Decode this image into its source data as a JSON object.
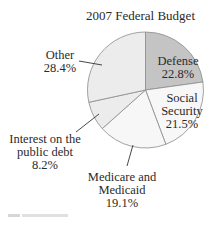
{
  "chart_data": {
    "type": "pie",
    "title": "2007 Federal Budget",
    "categories": [
      "Defense",
      "Social Security",
      "Medicare and Medicaid",
      "Interest on the public debt",
      "Other"
    ],
    "values": [
      22.8,
      21.5,
      19.1,
      8.2,
      28.4
    ],
    "unit": "%",
    "start_angle": "12 o'clock, clockwise",
    "colors": [
      "#c4c4c4",
      "#f7f7f7",
      "#f7f7f7",
      "#ececec",
      "#ececec"
    ],
    "labels": [
      {
        "name": "Defense",
        "value": "22.8%",
        "position": "inside"
      },
      {
        "name": "Social Security",
        "value": "21.5%",
        "position": "inside"
      },
      {
        "name": "Medicare and Medicaid",
        "value": "19.1%",
        "position": "outside-leader"
      },
      {
        "name": "Interest on the public debt",
        "value": "8.2%",
        "position": "outside-leader"
      },
      {
        "name": "Other",
        "value": "28.4%",
        "position": "outside-leader"
      }
    ]
  },
  "labels": {
    "title": "2007 Federal Budget",
    "defense_name": "Defense",
    "defense_value": "22.8%",
    "ss_name_1": "Social",
    "ss_name_2": "Security",
    "ss_value": "21.5%",
    "medicare_name_1": "Medicare and",
    "medicare_name_2": "Medicaid",
    "medicare_value": "19.1%",
    "interest_name_1": "Interest on the",
    "interest_name_2": "public debt",
    "interest_value": "8.2%",
    "other_name": "Other",
    "other_value": "28.4%"
  }
}
